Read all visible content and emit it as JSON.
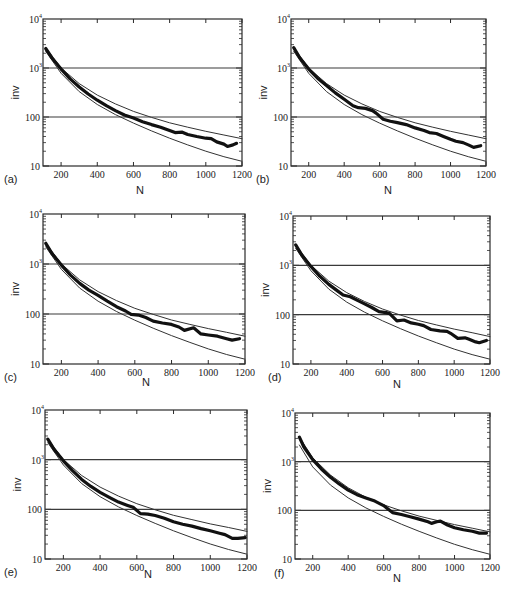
{
  "figure": {
    "panel_labels": [
      "(a)",
      "(b)",
      "(c)",
      "(d)",
      "(e)",
      "(f)"
    ],
    "colors": {
      "axis": "#2a2a2a",
      "thin_curve": "#333333",
      "thick_curve": "#111111",
      "background": "#ffffff"
    }
  },
  "chart_data": [
    {
      "panel": "(a)",
      "type": "line",
      "title": "",
      "xlabel": "N",
      "ylabel": "inv",
      "yscale": "log",
      "xlim": [
        100,
        1200
      ],
      "ylim": [
        10,
        10000
      ],
      "xticks": [
        "200",
        "400",
        "600",
        "800",
        "1000",
        "1200"
      ],
      "yticks": [
        "10",
        "100",
        "10^3",
        "10^4"
      ],
      "hlines": [
        100,
        1000
      ],
      "series": [
        {
          "name": "upper bound",
          "style": "thin",
          "x": [
            115,
            200,
            300,
            400,
            500,
            600,
            700,
            800,
            900,
            1000,
            1100,
            1200
          ],
          "y": [
            2600,
            1000,
            480,
            280,
            185,
            130,
            98,
            76,
            62,
            51,
            43,
            36
          ]
        },
        {
          "name": "lower bound",
          "style": "thin",
          "x": [
            115,
            200,
            300,
            400,
            500,
            600,
            700,
            800,
            900,
            1000,
            1100,
            1200
          ],
          "y": [
            2200,
            780,
            330,
            180,
            112,
            75,
            52,
            37,
            27,
            20,
            15.5,
            12.5
          ]
        },
        {
          "name": "measured",
          "style": "thick",
          "x": [
            115,
            150,
            200,
            250,
            300,
            350,
            400,
            450,
            500,
            550,
            600,
            650,
            700,
            750,
            800,
            830,
            870,
            900,
            950,
            1000,
            1030,
            1060,
            1100,
            1120,
            1150,
            1170
          ],
          "y": [
            2500,
            1600,
            950,
            600,
            410,
            295,
            220,
            170,
            135,
            110,
            95,
            80,
            70,
            62,
            53,
            48,
            49,
            44,
            40,
            37,
            36,
            31,
            28,
            25,
            27,
            29
          ]
        }
      ]
    },
    {
      "panel": "(b)",
      "type": "line",
      "title": "",
      "xlabel": "N",
      "ylabel": "inv",
      "yscale": "log",
      "xlim": [
        100,
        1200
      ],
      "ylim": [
        10,
        10000
      ],
      "xticks": [
        "200",
        "400",
        "600",
        "800",
        "1000",
        "1200"
      ],
      "yticks": [
        "10",
        "100",
        "10^3",
        "10^4"
      ],
      "hlines": [
        100,
        1000
      ],
      "series": [
        {
          "name": "upper bound",
          "style": "thin",
          "x": [
            115,
            200,
            300,
            400,
            500,
            600,
            700,
            800,
            900,
            1000,
            1100,
            1200
          ],
          "y": [
            2600,
            1000,
            480,
            280,
            185,
            130,
            98,
            76,
            62,
            51,
            43,
            36
          ]
        },
        {
          "name": "lower bound",
          "style": "thin",
          "x": [
            115,
            200,
            300,
            400,
            500,
            600,
            700,
            800,
            900,
            1000,
            1100,
            1200
          ],
          "y": [
            2200,
            780,
            330,
            180,
            112,
            75,
            52,
            37,
            27,
            20,
            15.5,
            12.5
          ]
        },
        {
          "name": "measured",
          "style": "thick",
          "x": [
            115,
            150,
            200,
            250,
            300,
            350,
            400,
            450,
            480,
            520,
            560,
            580,
            620,
            660,
            700,
            750,
            800,
            850,
            880,
            920,
            960,
            1000,
            1030,
            1070,
            1100,
            1130,
            1170
          ],
          "y": [
            2600,
            1600,
            950,
            620,
            440,
            310,
            230,
            170,
            155,
            150,
            135,
            120,
            90,
            82,
            77,
            70,
            60,
            53,
            48,
            46,
            40,
            35,
            32,
            30,
            27,
            24,
            26
          ]
        }
      ]
    },
    {
      "panel": "(c)",
      "type": "line",
      "title": "",
      "xlabel": "N",
      "ylabel": "inv",
      "yscale": "log",
      "xlim": [
        100,
        1200
      ],
      "ylim": [
        10,
        10000
      ],
      "xticks": [
        "200",
        "400",
        "600",
        "800",
        "1000",
        "1200"
      ],
      "yticks": [
        "10",
        "100",
        "10^3",
        "10^4"
      ],
      "hlines": [
        100,
        1000
      ],
      "series": [
        {
          "name": "upper bound",
          "style": "thin",
          "x": [
            115,
            200,
            300,
            400,
            500,
            600,
            700,
            800,
            900,
            1000,
            1100,
            1200
          ],
          "y": [
            2600,
            1000,
            480,
            280,
            185,
            130,
            98,
            76,
            62,
            51,
            43,
            36
          ]
        },
        {
          "name": "lower bound",
          "style": "thin",
          "x": [
            115,
            200,
            300,
            400,
            500,
            600,
            700,
            800,
            900,
            1000,
            1100,
            1200
          ],
          "y": [
            2200,
            780,
            330,
            180,
            112,
            75,
            52,
            37,
            27,
            20,
            15.5,
            12.5
          ]
        },
        {
          "name": "measured",
          "style": "thick",
          "x": [
            115,
            150,
            200,
            250,
            300,
            350,
            400,
            450,
            500,
            550,
            580,
            620,
            660,
            700,
            750,
            800,
            840,
            870,
            920,
            960,
            1000,
            1050,
            1100,
            1130,
            1170
          ],
          "y": [
            2600,
            1600,
            950,
            600,
            410,
            300,
            235,
            180,
            140,
            115,
            98,
            95,
            85,
            72,
            66,
            62,
            55,
            47,
            53,
            40,
            38,
            36,
            32,
            30,
            32
          ]
        }
      ]
    },
    {
      "panel": "(d)",
      "type": "line",
      "title": "",
      "xlabel": "N",
      "ylabel": "inv",
      "yscale": "log",
      "xlim": [
        100,
        1200
      ],
      "ylim": [
        10,
        10000
      ],
      "xticks": [
        "200",
        "400",
        "600",
        "800",
        "1000",
        "1200"
      ],
      "yticks": [
        "10",
        "100",
        "10^3",
        "10^4"
      ],
      "hlines": [
        100,
        1000
      ],
      "series": [
        {
          "name": "upper bound",
          "style": "thin",
          "x": [
            115,
            200,
            300,
            400,
            500,
            600,
            700,
            800,
            900,
            1000,
            1100,
            1200
          ],
          "y": [
            2600,
            1000,
            480,
            280,
            185,
            130,
            98,
            76,
            62,
            51,
            43,
            36
          ]
        },
        {
          "name": "lower bound",
          "style": "thin",
          "x": [
            115,
            200,
            300,
            400,
            500,
            600,
            700,
            800,
            900,
            1000,
            1100,
            1200
          ],
          "y": [
            2200,
            780,
            330,
            180,
            112,
            75,
            52,
            37,
            27,
            20,
            15.5,
            12.5
          ]
        },
        {
          "name": "measured",
          "style": "thick",
          "x": [
            115,
            150,
            200,
            250,
            300,
            350,
            380,
            420,
            460,
            500,
            540,
            580,
            620,
            640,
            680,
            720,
            760,
            800,
            830,
            870,
            920,
            960,
            980,
            1020,
            1060,
            1080,
            1120,
            1140,
            1180
          ],
          "y": [
            2600,
            1600,
            950,
            600,
            410,
            300,
            250,
            230,
            195,
            165,
            140,
            115,
            110,
            105,
            75,
            78,
            68,
            64,
            60,
            50,
            47,
            46,
            42,
            33,
            34,
            32,
            28,
            27,
            30
          ]
        }
      ]
    },
    {
      "panel": "(e)",
      "type": "line",
      "title": "",
      "xlabel": "N",
      "ylabel": "inv",
      "yscale": "log",
      "xlim": [
        100,
        1200
      ],
      "ylim": [
        10,
        10000
      ],
      "xticks": [
        "200",
        "400",
        "600",
        "800",
        "1000",
        "1200"
      ],
      "yticks": [
        "10",
        "100",
        "10^3",
        "10^4"
      ],
      "hlines": [
        100,
        1000
      ],
      "series": [
        {
          "name": "upper bound",
          "style": "thin",
          "x": [
            115,
            200,
            300,
            400,
            500,
            600,
            700,
            800,
            900,
            1000,
            1100,
            1200
          ],
          "y": [
            2600,
            1000,
            480,
            280,
            185,
            130,
            98,
            76,
            62,
            51,
            43,
            36
          ]
        },
        {
          "name": "lower bound",
          "style": "thin",
          "x": [
            115,
            200,
            300,
            400,
            500,
            600,
            700,
            800,
            900,
            1000,
            1100,
            1200
          ],
          "y": [
            2200,
            780,
            330,
            180,
            112,
            75,
            52,
            37,
            27,
            20,
            15.5,
            12.5
          ]
        },
        {
          "name": "measured",
          "style": "thick",
          "x": [
            115,
            150,
            200,
            250,
            300,
            350,
            400,
            450,
            500,
            550,
            580,
            620,
            660,
            700,
            750,
            800,
            850,
            900,
            950,
            1000,
            1050,
            1080,
            1120,
            1150,
            1190
          ],
          "y": [
            2600,
            1600,
            950,
            600,
            400,
            290,
            220,
            175,
            140,
            120,
            110,
            82,
            80,
            75,
            66,
            56,
            50,
            46,
            41,
            37,
            33,
            31,
            26,
            26,
            27
          ]
        }
      ]
    },
    {
      "panel": "(f)",
      "type": "line",
      "title": "",
      "xlabel": "N",
      "ylabel": "inv",
      "yscale": "log",
      "xlim": [
        100,
        1200
      ],
      "ylim": [
        10,
        10000
      ],
      "xticks": [
        "200",
        "400",
        "600",
        "800",
        "1000",
        "1200"
      ],
      "yticks": [
        "10",
        "100",
        "10^3",
        "10^4"
      ],
      "hlines": [
        100,
        1000
      ],
      "series": [
        {
          "name": "upper bound",
          "style": "thin",
          "x": [
            125,
            200,
            300,
            400,
            500,
            600,
            700,
            800,
            900,
            1000,
            1100,
            1200
          ],
          "y": [
            3200,
            1200,
            530,
            290,
            185,
            130,
            98,
            76,
            62,
            51,
            43,
            36
          ]
        },
        {
          "name": "lower bound",
          "style": "thin",
          "x": [
            125,
            200,
            300,
            400,
            500,
            600,
            700,
            800,
            900,
            1000,
            1100,
            1200
          ],
          "y": [
            2200,
            780,
            330,
            180,
            112,
            75,
            52,
            37,
            27,
            20,
            15.5,
            12.5
          ]
        },
        {
          "name": "measured",
          "style": "thick",
          "x": [
            125,
            150,
            200,
            250,
            300,
            350,
            400,
            450,
            500,
            550,
            600,
            650,
            700,
            750,
            800,
            850,
            870,
            900,
            920,
            960,
            1000,
            1050,
            1100,
            1140,
            1180
          ],
          "y": [
            3200,
            2000,
            1100,
            700,
            480,
            350,
            260,
            210,
            180,
            155,
            125,
            90,
            82,
            74,
            66,
            58,
            54,
            58,
            60,
            50,
            44,
            40,
            37,
            34,
            34
          ]
        }
      ]
    }
  ]
}
